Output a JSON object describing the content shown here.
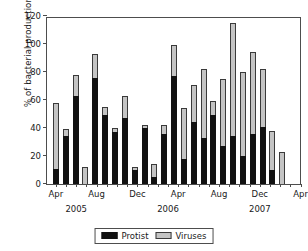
{
  "chart_data": {
    "type": "bar",
    "subtype": "stacked",
    "title": "",
    "xlabel": "",
    "ylabel": "% of bacterial production",
    "ylim": [
      0,
      120
    ],
    "yticks": [
      0,
      20,
      40,
      60,
      80,
      100,
      120
    ],
    "grid": false,
    "legend_position": "bottom-center",
    "legend": [
      "Protist",
      "Viruses"
    ],
    "colors": {
      "protist": "#111111",
      "viruses": "#c4c4c4"
    },
    "categories": [
      "Apr 2005",
      "May 2005",
      "Jun 2005",
      "Jul 2005",
      "Aug 2005",
      "Sep 2005",
      "Oct 2005",
      "Nov 2005",
      "Dec 2005",
      "Jan 2006",
      "Feb 2006",
      "Mar 2006",
      "Apr 2006",
      "May 2006",
      "Jun 2006",
      "Jul 2006",
      "Aug 2006",
      "Sep 2006",
      "Oct 2006",
      "Nov 2006",
      "Dec 2006",
      "Jan 2007",
      "Feb 2007",
      "Mar 2007",
      "Apr 2007"
    ],
    "series": [
      {
        "name": "Protist",
        "values": [
          11,
          34,
          63,
          0,
          76,
          49,
          37,
          47,
          10,
          40,
          5,
          36,
          77,
          18,
          44,
          33,
          49,
          27,
          34,
          20,
          36,
          41,
          10,
          0,
          0
        ]
      },
      {
        "name": "Viruses",
        "values": [
          47,
          5,
          15,
          12,
          17,
          6,
          3,
          16,
          2,
          2,
          9,
          6,
          22,
          36,
          27,
          49,
          10,
          48,
          81,
          60,
          58,
          41,
          28,
          23,
          0
        ]
      }
    ],
    "totals": [
      58,
      39,
      78,
      12,
      93,
      55,
      40,
      63,
      12,
      42,
      14,
      42,
      99,
      54,
      71,
      82,
      59,
      75,
      115,
      80,
      94,
      82,
      38,
      23,
      0
    ],
    "xaxis_tick_labels": [
      {
        "index": 0,
        "label": "Apr"
      },
      {
        "index": 4,
        "label": "Aug"
      },
      {
        "index": 8,
        "label": "Dec"
      },
      {
        "index": 12,
        "label": "Apr"
      },
      {
        "index": 16,
        "label": "Aug"
      },
      {
        "index": 20,
        "label": "Dec"
      },
      {
        "index": 24,
        "label": "Apr"
      }
    ],
    "year_labels": [
      {
        "index": 2,
        "label": "2005"
      },
      {
        "index": 11,
        "label": "2006"
      },
      {
        "index": 20,
        "label": "2007"
      }
    ]
  }
}
